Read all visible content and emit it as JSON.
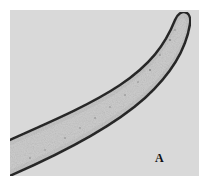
{
  "figure": {
    "panel_label": "A",
    "colors": {
      "background": "#d9d9d9",
      "tube_fill": "#c4c4c4",
      "tube_wall": "#2a2a2a",
      "page": "#ffffff"
    }
  }
}
